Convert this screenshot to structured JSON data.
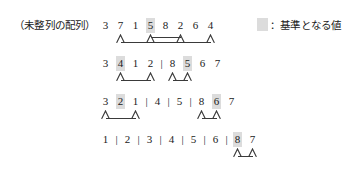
{
  "caption": "（未整列の配列）",
  "legend": {
    "swatch_name": "pivot-swatch",
    "swatch_color": "#dcdcdc",
    "text": "：基準となる値"
  },
  "colors": {
    "pivot_highlight": "#dcdcdc",
    "ink": "#1a1a1a",
    "rule": "#3a3a3a",
    "background": "#ffffff"
  },
  "chart_data": {
    "type": "diagram",
    "title": "（未整列の配列）",
    "rows": [
      {
        "index": 0,
        "values": [
          "3",
          "7",
          "1",
          "5",
          "8",
          "2",
          "6",
          "4"
        ],
        "pivots": [
          3
        ],
        "separators_after": [],
        "brackets": [
          {
            "from": 1,
            "to": 7,
            "level": "low"
          },
          {
            "from": 3,
            "to": 5,
            "level": "high"
          }
        ],
        "carets": [
          1,
          3,
          5,
          7
        ]
      },
      {
        "index": 1,
        "values": [
          "3",
          "4",
          "1",
          "2",
          "8",
          "5",
          "6",
          "7"
        ],
        "pivots": [
          1,
          5
        ],
        "separators_after": [
          3
        ],
        "brackets": [
          {
            "from": 1,
            "to": 3,
            "level": "low"
          },
          {
            "from": 4,
            "to": 5,
            "level": "low"
          }
        ],
        "carets": [
          1,
          3,
          4,
          5
        ]
      },
      {
        "index": 2,
        "values": [
          "3",
          "2",
          "1",
          "4",
          "5",
          "8",
          "6",
          "7"
        ],
        "pivots": [
          1,
          6
        ],
        "separators_after": [
          2,
          3,
          4
        ],
        "brackets": [
          {
            "from": 0,
            "to": 2,
            "level": "low"
          },
          {
            "from": 5,
            "to": 6,
            "level": "low"
          }
        ],
        "carets": [
          0,
          2,
          5,
          6
        ]
      },
      {
        "index": 3,
        "values": [
          "1",
          "2",
          "3",
          "4",
          "5",
          "6",
          "8",
          "7"
        ],
        "pivots": [
          6
        ],
        "separators_after": [
          0,
          1,
          2,
          3,
          4,
          5
        ],
        "brackets": [
          {
            "from": 6,
            "to": 7,
            "level": "low"
          }
        ],
        "carets": [
          6,
          7
        ]
      }
    ]
  }
}
